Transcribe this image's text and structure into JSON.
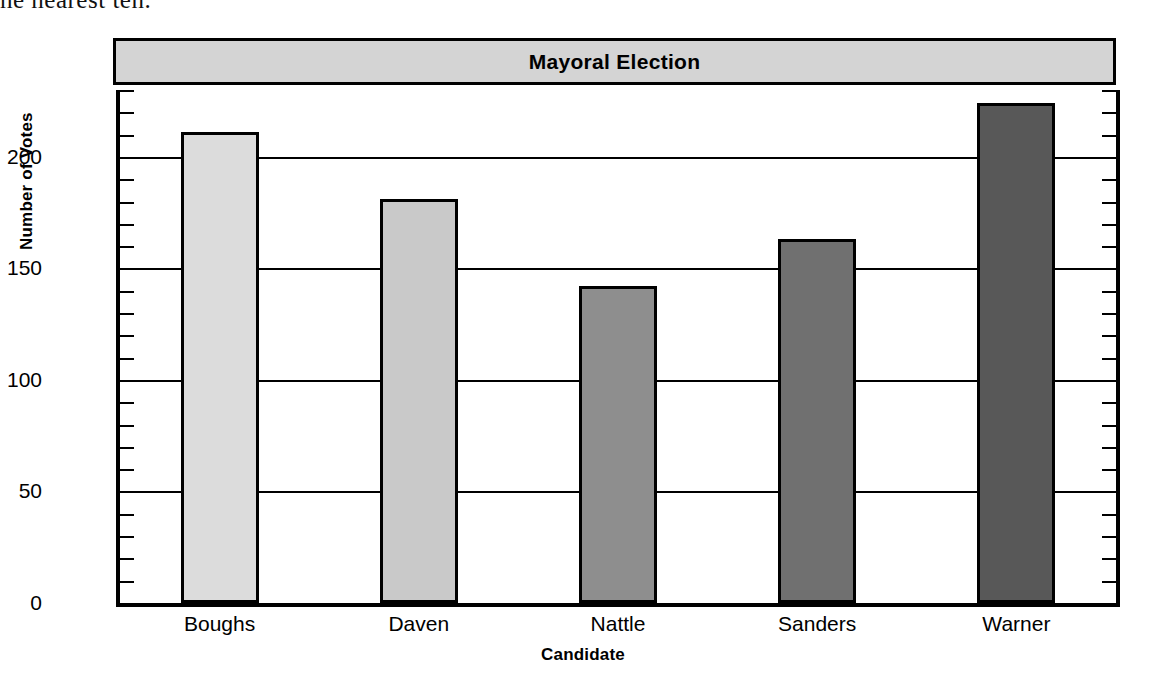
{
  "page": {
    "fragment_text": "he nearest ten."
  },
  "chart_data": {
    "type": "bar",
    "title": "Mayoral Election",
    "xlabel": "Candidate",
    "ylabel": "Number of Votes",
    "categories": [
      "Boughs",
      "Daven",
      "Nattle",
      "Sanders",
      "Warner"
    ],
    "values": [
      211,
      181,
      142,
      163,
      224
    ],
    "ylim": [
      0,
      230
    ],
    "ytick_labels": [
      "0",
      "50",
      "100",
      "150",
      "200"
    ],
    "ytick_values": [
      0,
      50,
      100,
      150,
      200
    ],
    "minor_tick_interval": 10,
    "grid": "horizontal-major",
    "legend": "none",
    "bar_colors": [
      "#dcdcdc",
      "#c9c9c9",
      "#8e8e8e",
      "#707070",
      "#585858"
    ],
    "bar_edge_color": "#000000",
    "title_banner_color": "#d4d4d4",
    "axis_color": "#000000"
  }
}
